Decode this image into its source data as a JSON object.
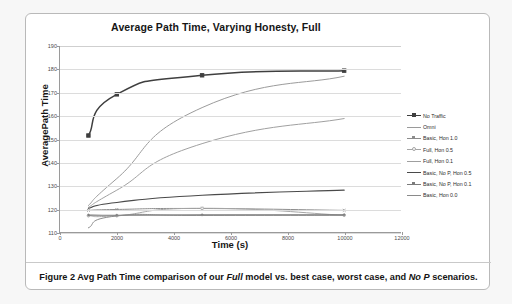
{
  "figure": {
    "caption_prefix": "Figure 2 Avg Path Time comparison of our ",
    "caption_em1": "Full",
    "caption_mid": " model vs. best case, worst case, and ",
    "caption_em2": "No P",
    "caption_suffix": " scenarios.",
    "caption_full": "Figure 2 Avg Path Time comparison of our Full model vs. best case, worst case, and No P scenarios."
  },
  "chart_data": {
    "type": "line",
    "title": "Average Path Time, Varying Honesty, Full",
    "xlabel": "Time (s)",
    "ylabel": "AveragePath Time",
    "xlim": [
      0,
      12000
    ],
    "ylim": [
      110,
      190
    ],
    "xticks": [
      0,
      2000,
      4000,
      6000,
      8000,
      10000,
      12000
    ],
    "yticks": [
      110,
      120,
      130,
      140,
      150,
      160,
      170,
      180,
      190
    ],
    "grid": "horizontal",
    "legend_position": "right",
    "x": [
      1000,
      2000,
      5000,
      10000
    ],
    "series": [
      {
        "name": "No Traffic",
        "values": [
          151.5,
          169.2,
          177.4,
          179.4
        ],
        "color": "#3f3f3f",
        "width": 1.5,
        "marker": "square",
        "marker_size": 3.4
      },
      {
        "name": "Omni",
        "values": [
          121.4,
          133.0,
          163.5,
          177.0
        ],
        "color": "#9a9a9a",
        "width": 1,
        "marker": "none",
        "marker_size": 0
      },
      {
        "name": "Basic, Hon 1.0",
        "values": [
          119.3,
          119.7,
          120.1,
          119.3
        ],
        "color": "#8c8c8c",
        "width": 1,
        "marker": "cross",
        "marker_size": 2.6
      },
      {
        "name": "Full, Hon 0.5",
        "values": [
          117.0,
          117.0,
          120.2,
          117.2
        ],
        "color": "#a5a5a5",
        "width": 1,
        "marker": "circle",
        "marker_size": 2.6
      },
      {
        "name": "Full, Hon 0.1",
        "values": [
          120.6,
          128.0,
          148.0,
          158.8
        ],
        "color": "#9f9f9f",
        "width": 1,
        "marker": "none",
        "marker_size": 0
      },
      {
        "name": "Basic, No P, Hon 0.5",
        "values": [
          120.2,
          122.7,
          125.8,
          128.0
        ],
        "color": "#4a4a4a",
        "width": 1.2,
        "marker": "none",
        "marker_size": 0
      },
      {
        "name": "Basic, No P, Hon 0.1",
        "values": [
          117.3,
          117.2,
          117.4,
          117.4
        ],
        "color": "#7b7b7b",
        "width": 1.2,
        "marker": "plus",
        "marker_size": 2.8
      },
      {
        "name": "Basic, Hon 0.0",
        "values": [
          111.8,
          116.9,
          117.1,
          117.2
        ],
        "color": "#8a8a8a",
        "width": 1,
        "marker": "none",
        "marker_size": 0
      }
    ]
  }
}
